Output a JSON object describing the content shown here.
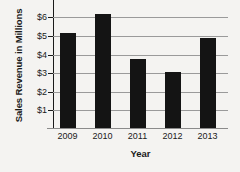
{
  "chart_data": {
    "type": "bar",
    "title": "",
    "xlabel": "Year",
    "ylabel": "Sales Revenue in Millions",
    "categories": [
      "2009",
      "2010",
      "2011",
      "2012",
      "2013"
    ],
    "values": [
      5.1,
      6.15,
      3.7,
      3.0,
      4.85
    ],
    "ytick_labels": [
      "$1",
      "$2",
      "$3",
      "$4",
      "$5",
      "$6"
    ],
    "ytick_values": [
      1,
      2,
      3,
      4,
      5,
      6
    ],
    "ylim": [
      0,
      6.5
    ],
    "grid": true,
    "legend": false,
    "bar_color": "#141414",
    "grid_color": "#9a9a9a",
    "background_color": "#f4f3f1"
  }
}
